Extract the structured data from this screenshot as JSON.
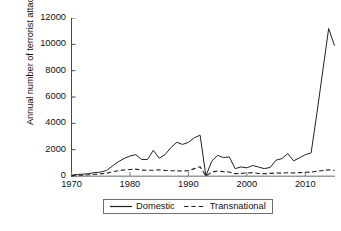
{
  "chart_data": {
    "type": "line",
    "title": "",
    "xlabel": "",
    "ylabel": "Annual number of terrorist attacks",
    "xlim": [
      1970,
      2015
    ],
    "ylim": [
      0,
      12000
    ],
    "grid": false,
    "legend_position": "bottom",
    "xticks": [
      1970,
      1980,
      1990,
      2000,
      2010
    ],
    "xtick_labels": [
      "1970",
      "1980",
      "1990",
      "2000",
      "2010"
    ],
    "yticks": [
      0,
      2000,
      4000,
      6000,
      8000,
      10000,
      12000
    ],
    "ytick_labels": [
      "0",
      "2000",
      "4000",
      "6000",
      "8000",
      "10000",
      "12000"
    ],
    "x": [
      1970,
      1971,
      1972,
      1973,
      1974,
      1975,
      1976,
      1977,
      1978,
      1979,
      1980,
      1981,
      1982,
      1983,
      1984,
      1985,
      1986,
      1987,
      1988,
      1989,
      1990,
      1991,
      1992,
      1993,
      1994,
      1995,
      1996,
      1997,
      1998,
      1999,
      2000,
      2001,
      2002,
      2003,
      2004,
      2005,
      2006,
      2007,
      2008,
      2009,
      2010,
      2011,
      2012,
      2013,
      2014,
      2015
    ],
    "series": [
      {
        "name": "Domestic",
        "style": "solid",
        "color": "#222222",
        "values": [
          60,
          120,
          140,
          180,
          260,
          300,
          420,
          760,
          1080,
          1330,
          1520,
          1620,
          1250,
          1250,
          1950,
          1350,
          1620,
          2150,
          2560,
          2400,
          2550,
          2900,
          3100,
          0,
          1130,
          1570,
          1400,
          1450,
          560,
          690,
          620,
          800,
          680,
          560,
          650,
          1200,
          1320,
          1700,
          1150,
          1380,
          1620,
          1750,
          4800,
          8000,
          11200,
          9900
        ]
      },
      {
        "name": "Transnational",
        "style": "dashed",
        "color": "#222222",
        "values": [
          30,
          60,
          70,
          90,
          130,
          160,
          210,
          330,
          400,
          460,
          490,
          520,
          450,
          440,
          440,
          470,
          430,
          400,
          390,
          380,
          400,
          560,
          700,
          0,
          290,
          380,
          330,
          300,
          180,
          200,
          230,
          250,
          190,
          170,
          200,
          230,
          220,
          250,
          230,
          260,
          280,
          300,
          360,
          420,
          470,
          420
        ]
      }
    ]
  },
  "legend": {
    "entries": [
      {
        "label": "Domestic",
        "style": "solid"
      },
      {
        "label": "Transnational",
        "style": "dashed"
      }
    ]
  },
  "axes": {
    "ylabel_text": "Annual number of terrorist attacks"
  }
}
